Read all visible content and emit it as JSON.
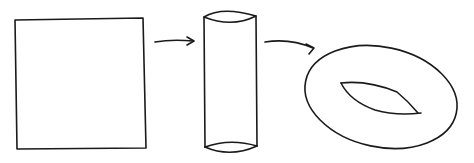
{
  "diagram": {
    "shapes": [
      {
        "id": "square",
        "label": "square"
      },
      {
        "id": "cylinder",
        "label": "cylinder"
      },
      {
        "id": "torus",
        "label": "torus"
      }
    ],
    "edges": [
      {
        "from": "square",
        "to": "cylinder"
      },
      {
        "from": "cylinder",
        "to": "torus"
      }
    ],
    "colors": {
      "stroke": "#1a1a1a",
      "background": "#ffffff"
    }
  }
}
